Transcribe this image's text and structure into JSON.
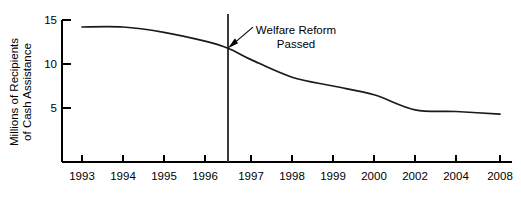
{
  "chart_data": {
    "type": "line",
    "title": "",
    "xlabel": "",
    "ylabel_line1": "Millions of Recipients",
    "ylabel_line2": "of Cash Assistance",
    "x_tick_labels": [
      "1993",
      "1994",
      "1995",
      "1996",
      "1997",
      "1998",
      "1999",
      "2000",
      "2002",
      "2004",
      "2008"
    ],
    "y_tick_labels": [
      "5",
      "10",
      "15"
    ],
    "y_tick_values": [
      5,
      10,
      15
    ],
    "ylim": [
      0,
      15
    ],
    "grid": false,
    "legend": "none",
    "categories": [
      "1993",
      "1994",
      "1995",
      "1996",
      "1996.5",
      "1997",
      "1998",
      "1999",
      "2000",
      "2002",
      "2004",
      "2008"
    ],
    "values": [
      14.2,
      14.2,
      13.6,
      12.6,
      11.8,
      10.5,
      8.5,
      7.5,
      6.5,
      4.8,
      4.6,
      4.3
    ],
    "series": [
      {
        "name": "Recipients of Cash Assistance",
        "points": [
          {
            "x": "1993",
            "y": 14.2
          },
          {
            "x": "1994",
            "y": 14.2
          },
          {
            "x": "1995",
            "y": 13.6
          },
          {
            "x": "1996",
            "y": 12.6
          },
          {
            "x": "1996.5",
            "y": 11.8
          },
          {
            "x": "1997",
            "y": 10.5
          },
          {
            "x": "1998",
            "y": 8.5
          },
          {
            "x": "1999",
            "y": 7.5
          },
          {
            "x": "2000",
            "y": 6.5
          },
          {
            "x": "2002",
            "y": 4.8
          },
          {
            "x": "2004",
            "y": 4.6
          },
          {
            "x": "2008",
            "y": 4.3
          }
        ]
      }
    ],
    "annotations": [
      {
        "name": "welfare-reform-passed",
        "line1": "Welfare Reform",
        "line2": "Passed",
        "at_x": "1996.5",
        "at_y": 11.8,
        "marker": "vertical-line-with-arrow"
      }
    ],
    "colors": {
      "line": "#1a1a1a",
      "axis": "#000000",
      "event_line": "#3a3a3a",
      "background": "#ffffff"
    }
  }
}
